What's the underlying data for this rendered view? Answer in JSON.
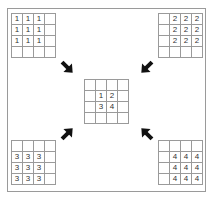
{
  "diagram": {
    "type": "quadrant-merge",
    "grids": {
      "top_left": [
        [
          "1",
          "1",
          "1",
          ""
        ],
        [
          "1",
          "1",
          "1",
          ""
        ],
        [
          "1",
          "1",
          "1",
          ""
        ],
        [
          "",
          "",
          "",
          ""
        ]
      ],
      "top_right": [
        [
          "",
          "2",
          "2",
          "2"
        ],
        [
          "",
          "2",
          "2",
          "2"
        ],
        [
          "",
          "2",
          "2",
          "2"
        ],
        [
          "",
          "",
          "",
          ""
        ]
      ],
      "bottom_left": [
        [
          "",
          "",
          "",
          ""
        ],
        [
          "3",
          "3",
          "3",
          ""
        ],
        [
          "3",
          "3",
          "3",
          ""
        ],
        [
          "3",
          "3",
          "3",
          ""
        ]
      ],
      "bottom_right": [
        [
          "",
          "",
          "",
          ""
        ],
        [
          "",
          "4",
          "4",
          "4"
        ],
        [
          "",
          "4",
          "4",
          "4"
        ],
        [
          "",
          "4",
          "4",
          "4"
        ]
      ],
      "center": [
        [
          "",
          "",
          "",
          ""
        ],
        [
          "",
          "1",
          "2",
          ""
        ],
        [
          "",
          "3",
          "4",
          ""
        ],
        [
          "",
          "",
          "",
          ""
        ]
      ]
    },
    "arrows": [
      {
        "from": "top_left",
        "to": "center",
        "direction": "down-right"
      },
      {
        "from": "top_right",
        "to": "center",
        "direction": "down-left"
      },
      {
        "from": "bottom_left",
        "to": "center",
        "direction": "up-right"
      },
      {
        "from": "bottom_right",
        "to": "center",
        "direction": "up-left"
      }
    ],
    "colors": {
      "line": "#9a9a9a",
      "arrow": "#111111",
      "text": "#333333"
    }
  }
}
